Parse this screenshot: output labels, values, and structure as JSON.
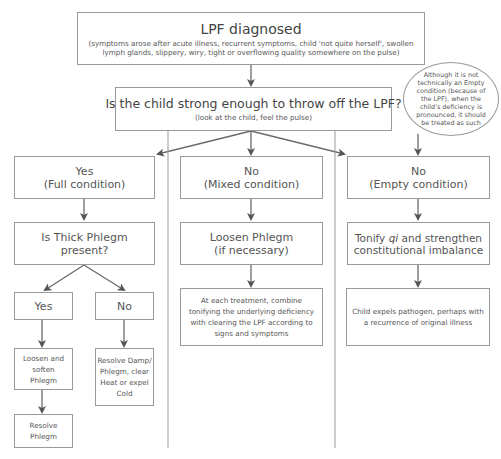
{
  "diagram": {
    "root": {
      "title": "LPF diagnosed",
      "subtitle_line1": "(symptoms arose after acute illness, recurrent symptoms, child 'not quite herself', swollen",
      "subtitle_line2": "lymph glands, slippery, wiry, tight or overflowing quality somewhere on the pulse)"
    },
    "question": {
      "title": "Is the child strong enough to throw off the LPF?",
      "subtitle": "(look at the child, feel the pulse)"
    },
    "note": {
      "text": "Although it is not technically an Empty condition (because of the LPF), when the child's deficiency is pronounced, it should be treated as such"
    },
    "branches": {
      "full": {
        "label_line1": "Yes",
        "label_line2": "(Full condition)",
        "question_line1": "Is Thick Phlegm",
        "question_line2": "present?",
        "yes": {
          "label": "Yes",
          "step1": "Loosen and soften Phlegm",
          "step2": "Resolve Phlegm"
        },
        "no": {
          "label": "No",
          "step1": "Resolve Damp/ Phlegm, clear Heat or expel Cold"
        }
      },
      "mixed": {
        "label_line1": "No",
        "label_line2": "(Mixed condition)",
        "step1_line1": "Loosen Phlegm",
        "step1_line2": "(if necessary)",
        "step2": "At each treatment, combine tonifying the underlying deficiency with clearing the LPF according to signs and symptoms"
      },
      "empty": {
        "label_line1": "No",
        "label_line2": "(Empty condition)",
        "step1_pre": "Tonify ",
        "step1_italic": "qi",
        "step1_post": " and strengthen",
        "step1_line2": "constitutional imbalance",
        "step2": "Child expels pathogen, perhaps with a recurrence of original illness"
      }
    },
    "colors": {
      "line": "#6a6a6a",
      "border": "#9a9a9a",
      "text": "#555555"
    }
  }
}
